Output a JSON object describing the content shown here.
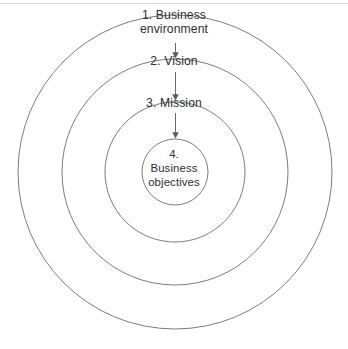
{
  "diagram": {
    "type": "concentric-circles",
    "title": "",
    "background_color": "#ffffff",
    "stroke_color": "#6e6e72",
    "text_color": "#2e2e33",
    "center": {
      "x": 175,
      "y": 172
    },
    "rings": [
      {
        "order": 1,
        "label": "1. Business\nenvironment",
        "radius": 157,
        "name": "business-environment"
      },
      {
        "order": 2,
        "label": "2. Vision",
        "radius": 113,
        "name": "vision"
      },
      {
        "order": 3,
        "label": "3. Mission",
        "radius": 70,
        "name": "mission"
      },
      {
        "order": 4,
        "label": "4.\nBusiness\nobjectives",
        "radius": 33,
        "name": "business-objectives"
      }
    ],
    "connectors": [
      {
        "from": "business-environment",
        "to": "vision",
        "direction": "down"
      },
      {
        "from": "vision",
        "to": "mission",
        "direction": "down"
      },
      {
        "from": "mission",
        "to": "business-objectives",
        "direction": "down"
      }
    ]
  }
}
